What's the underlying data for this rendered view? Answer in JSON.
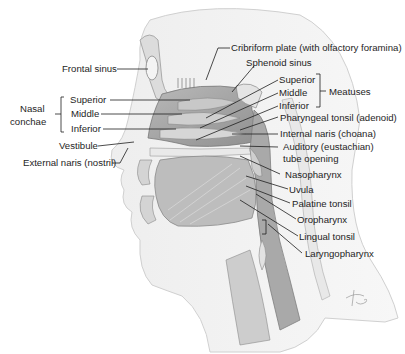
{
  "diagram": {
    "labels_left": {
      "frontal_sinus": "Frontal sinus",
      "nasal_conchae_group": "Nasal\nconchae",
      "nasal_conchae_line1": "Nasal",
      "nasal_conchae_line2": "conchae",
      "conchae": [
        "Superior",
        "Middle",
        "Inferior"
      ],
      "vestibule": "Vestibule",
      "external_naris": "External naris (nostril)"
    },
    "labels_right": {
      "cribriform_plate": "Cribriform plate (with olfactory foramina)",
      "sphenoid_sinus": "Sphenoid sinus",
      "meatuses": [
        "Superior",
        "Middle",
        "Inferior"
      ],
      "meatuses_group": "Meatuses",
      "pharyngeal_tonsil": "Pharyngeal tonsil (adenoid)",
      "internal_naris": "Internal naris (choana)",
      "auditory_tube_line1": "Auditory (eustachian)",
      "auditory_tube_line2": "tube opening",
      "nasopharynx": "Nasopharynx",
      "uvula": "Uvula",
      "palatine_tonsil": "Palatine tonsil",
      "oropharynx": "Oropharynx",
      "lingual_tonsil": "Lingual tonsil",
      "laryngopharynx": "Laryngopharynx"
    },
    "signature": "Tina",
    "colors": {
      "background": "#ffffff",
      "skin_shade": "#e6e6e6",
      "tissue_mid": "#c9c9c9",
      "tissue_dark": "#9a9a9a",
      "leader_line": "#1e1e1e",
      "text": "#1e1e1e"
    }
  }
}
